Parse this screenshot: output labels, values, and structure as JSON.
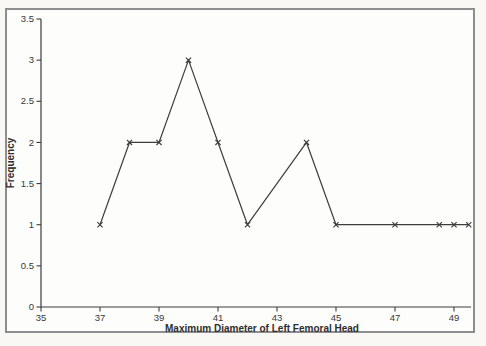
{
  "window": {
    "outer_background": "#f9f8f5",
    "frame_border_color": "#8e8e8e",
    "plot_background": "#fdfdfb"
  },
  "chart_data": {
    "type": "line",
    "title": "",
    "xlabel": "Maximum Diameter of Left Femoral Head",
    "ylabel": "Frequency",
    "x": [
      37,
      38,
      39,
      40,
      41,
      42,
      44,
      45,
      47,
      48.5,
      49,
      49.5
    ],
    "y": [
      1,
      2,
      2,
      3,
      2,
      1,
      2,
      1,
      1,
      1,
      1,
      1
    ],
    "x_ticks": [
      35,
      37,
      39,
      41,
      43,
      45,
      47,
      49
    ],
    "x_tick_labels": [
      "35",
      "37",
      "39",
      "41",
      "43",
      "45",
      "47",
      "49"
    ],
    "y_ticks": [
      0,
      0.5,
      1,
      1.5,
      2,
      2.5,
      3,
      3.5
    ],
    "y_tick_labels": [
      "0",
      "0.5",
      "1",
      "1.5",
      "2",
      "2.5",
      "3",
      "3.5"
    ],
    "xlim": [
      35,
      49.6
    ],
    "ylim": [
      0,
      3.5
    ],
    "marker": "x",
    "line_color": "#3d3d3d",
    "axis_color": "#3d3d3d",
    "grid": false,
    "legend": false
  }
}
